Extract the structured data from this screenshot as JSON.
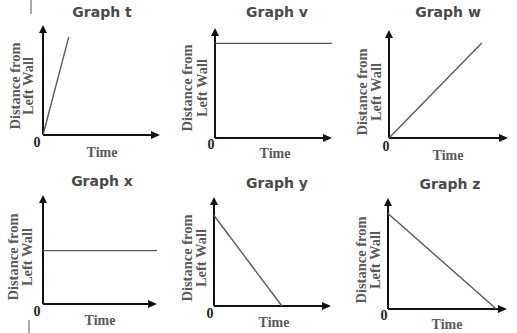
{
  "chart_data": [
    {
      "id": "t",
      "type": "line",
      "title": "Graph t",
      "xlabel": "Time",
      "ylabel": [
        "Distance from",
        "Left Wall"
      ],
      "origin_label": "0",
      "points": [
        [
          0,
          0
        ],
        [
          0.22,
          0.89
        ]
      ],
      "description": "steep increasing line from origin"
    },
    {
      "id": "v",
      "type": "line",
      "title": "Graph v",
      "xlabel": "Time",
      "ylabel": [
        "Distance from",
        "Left Wall"
      ],
      "origin_label": "0",
      "points": [
        [
          0,
          0.86
        ],
        [
          1.0,
          0.86
        ]
      ],
      "description": "horizontal line at high constant distance"
    },
    {
      "id": "w",
      "type": "line",
      "title": "Graph w",
      "xlabel": "Time",
      "ylabel": [
        "Distance from",
        "Left Wall"
      ],
      "origin_label": "0",
      "points": [
        [
          0,
          0
        ],
        [
          0.78,
          0.88
        ]
      ],
      "description": "moderate increasing line from origin"
    },
    {
      "id": "x",
      "type": "line",
      "title": "Graph x",
      "xlabel": "Time",
      "ylabel": [
        "Distance from",
        "Left Wall"
      ],
      "origin_label": "0",
      "points": [
        [
          0,
          0.49
        ],
        [
          1.0,
          0.49
        ]
      ],
      "description": "horizontal line at mid constant distance"
    },
    {
      "id": "y",
      "type": "line",
      "title": "Graph y",
      "xlabel": "Time",
      "ylabel": [
        "Distance from",
        "Left Wall"
      ],
      "origin_label": "0",
      "points": [
        [
          0,
          0.83
        ],
        [
          0.58,
          0
        ]
      ],
      "description": "steep decreasing line reaching zero"
    },
    {
      "id": "z",
      "type": "line",
      "title": "Graph z",
      "xlabel": "Time",
      "ylabel": [
        "Distance from",
        "Left Wall"
      ],
      "origin_label": "0",
      "points": [
        [
          0,
          0.86
        ],
        [
          0.91,
          0
        ]
      ],
      "description": "gradual decreasing line reaching zero"
    }
  ],
  "colors": {
    "axis": "#111111",
    "data_line": "#5a5a5a",
    "title": "#4a4a4a",
    "label": "#5a5a5a"
  }
}
